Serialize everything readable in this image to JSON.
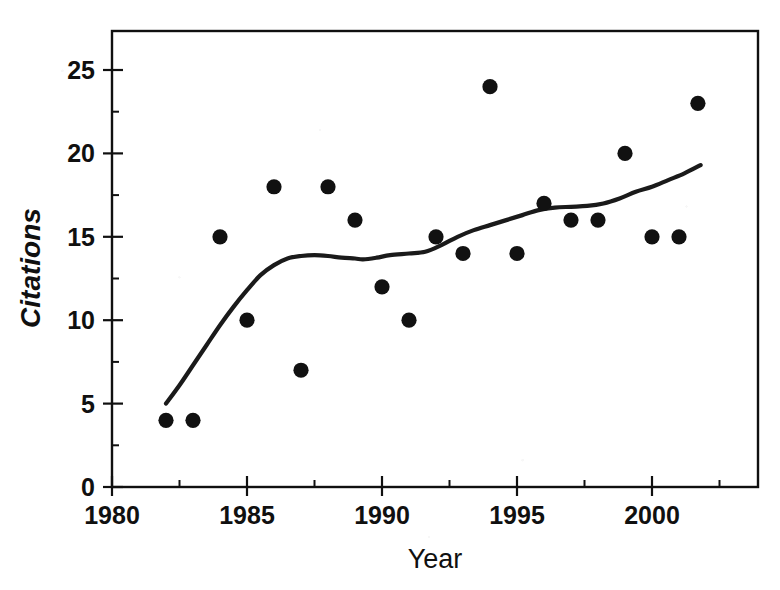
{
  "chart_data": {
    "type": "scatter",
    "title": "",
    "xlabel": "Year",
    "ylabel": "Citations",
    "xlim": [
      1980,
      2002.7
    ],
    "ylim": [
      0,
      26.5
    ],
    "grid": false,
    "legend": null,
    "x_ticks": [
      1980,
      1985,
      1990,
      1995,
      2000
    ],
    "x_tick_labels": [
      "1980",
      "1985",
      "1990",
      "1995",
      "2000"
    ],
    "x_minor_ticks": [
      1982.5,
      1987.5,
      1992.5,
      1997.5,
      2002.5
    ],
    "y_ticks": [
      0,
      5,
      10,
      15,
      20,
      25
    ],
    "y_tick_labels": [
      "0",
      "5",
      "10",
      "15",
      "20",
      "25"
    ],
    "y_minor_ticks": [
      2.5,
      7.5,
      12.5,
      17.5,
      22.5
    ],
    "series": [
      {
        "name": "Citations",
        "marker": "filled-circle",
        "color": "#111111",
        "points": [
          {
            "x": 1982,
            "y": 4
          },
          {
            "x": 1983,
            "y": 4
          },
          {
            "x": 1984,
            "y": 15
          },
          {
            "x": 1985,
            "y": 10
          },
          {
            "x": 1986,
            "y": 18
          },
          {
            "x": 1987,
            "y": 7
          },
          {
            "x": 1988,
            "y": 18
          },
          {
            "x": 1989,
            "y": 16
          },
          {
            "x": 1990,
            "y": 12
          },
          {
            "x": 1991,
            "y": 10
          },
          {
            "x": 1992,
            "y": 15
          },
          {
            "x": 1993,
            "y": 14
          },
          {
            "x": 1994,
            "y": 24
          },
          {
            "x": 1995,
            "y": 14
          },
          {
            "x": 1996,
            "y": 17
          },
          {
            "x": 1997,
            "y": 16
          },
          {
            "x": 1998,
            "y": 16
          },
          {
            "x": 1999,
            "y": 20
          },
          {
            "x": 2000,
            "y": 15
          },
          {
            "x": 2001,
            "y": 15
          },
          {
            "x": 2001.7,
            "y": 23
          }
        ]
      }
    ],
    "trend": {
      "name": "smoothed-trend",
      "color": "#1a1a1a",
      "points": [
        {
          "x": 1982.0,
          "y": 5.0
        },
        {
          "x": 1982.5,
          "y": 6.1
        },
        {
          "x": 1983.0,
          "y": 7.3
        },
        {
          "x": 1983.5,
          "y": 8.5
        },
        {
          "x": 1984.0,
          "y": 9.7
        },
        {
          "x": 1984.5,
          "y": 10.8
        },
        {
          "x": 1985.0,
          "y": 11.8
        },
        {
          "x": 1985.5,
          "y": 12.7
        },
        {
          "x": 1986.0,
          "y": 13.3
        },
        {
          "x": 1986.5,
          "y": 13.7
        },
        {
          "x": 1987.0,
          "y": 13.85
        },
        {
          "x": 1987.5,
          "y": 13.9
        },
        {
          "x": 1988.0,
          "y": 13.85
        },
        {
          "x": 1988.5,
          "y": 13.75
        },
        {
          "x": 1989.0,
          "y": 13.7
        },
        {
          "x": 1989.3,
          "y": 13.65
        },
        {
          "x": 1989.8,
          "y": 13.75
        },
        {
          "x": 1990.3,
          "y": 13.9
        },
        {
          "x": 1991.0,
          "y": 14.0
        },
        {
          "x": 1991.6,
          "y": 14.1
        },
        {
          "x": 1992.2,
          "y": 14.5
        },
        {
          "x": 1992.8,
          "y": 15.0
        },
        {
          "x": 1993.4,
          "y": 15.4
        },
        {
          "x": 1994.0,
          "y": 15.7
        },
        {
          "x": 1994.6,
          "y": 16.0
        },
        {
          "x": 1995.2,
          "y": 16.3
        },
        {
          "x": 1995.8,
          "y": 16.6
        },
        {
          "x": 1996.4,
          "y": 16.75
        },
        {
          "x": 1997.0,
          "y": 16.8
        },
        {
          "x": 1997.6,
          "y": 16.85
        },
        {
          "x": 1998.2,
          "y": 17.0
        },
        {
          "x": 1998.8,
          "y": 17.3
        },
        {
          "x": 1999.4,
          "y": 17.7
        },
        {
          "x": 2000.0,
          "y": 18.0
        },
        {
          "x": 2000.6,
          "y": 18.4
        },
        {
          "x": 2001.2,
          "y": 18.8
        },
        {
          "x": 2001.8,
          "y": 19.3
        }
      ]
    }
  },
  "axes": {
    "x_title": "Year",
    "y_title": "Citations"
  }
}
